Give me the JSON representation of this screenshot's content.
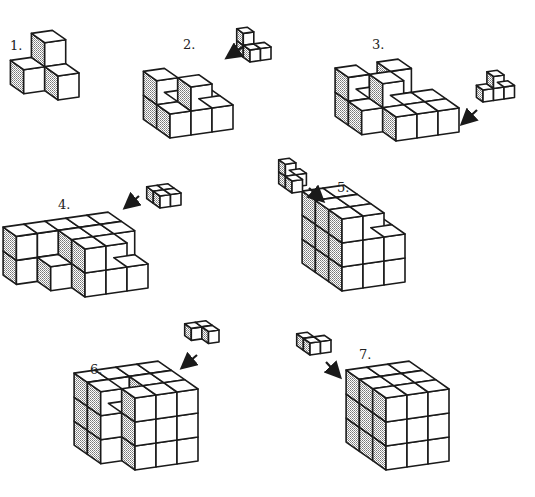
{
  "colors": {
    "line": "#1a1a1a",
    "face": "#ffffff",
    "shade": "#a8a8a8"
  },
  "steps": [
    {
      "label": "1.",
      "label_pos": [
        10,
        38
      ],
      "origin": [
        58,
        100
      ],
      "cubes": [
        [
          0,
          0,
          0
        ],
        [
          -1,
          1,
          0
        ],
        [
          0,
          1,
          0
        ],
        [
          0,
          1,
          1
        ]
      ],
      "piece": null,
      "arrow": null
    },
    {
      "label": "2.",
      "label_pos": [
        183,
        37
      ],
      "origin": [
        170,
        138
      ],
      "cubes": [
        [
          0,
          0,
          0
        ],
        [
          1,
          0,
          0
        ],
        [
          2,
          0,
          0
        ],
        [
          0,
          1,
          0
        ],
        [
          1,
          1,
          0
        ],
        [
          2,
          1,
          0
        ],
        [
          0,
          1,
          1
        ],
        [
          1,
          0,
          1
        ]
      ],
      "piece": {
        "origin": [
          250,
          62
        ],
        "scale": 0.5,
        "cubes": [
          [
            0,
            0,
            0
          ],
          [
            1,
            0,
            0
          ],
          [
            0,
            1,
            0
          ],
          [
            0,
            1,
            1
          ]
        ]
      },
      "arrow": {
        "from": [
          244,
          46
        ],
        "to": [
          228,
          57
        ]
      }
    },
    {
      "label": "3.",
      "label_pos": [
        372,
        37
      ],
      "origin": [
        396,
        141
      ],
      "cubes": [
        [
          0,
          0,
          0
        ],
        [
          1,
          0,
          0
        ],
        [
          2,
          0,
          0
        ],
        [
          -1,
          1,
          0
        ],
        [
          0,
          1,
          0
        ],
        [
          1,
          1,
          0
        ],
        [
          2,
          1,
          0
        ],
        [
          -1,
          2,
          0
        ],
        [
          0,
          2,
          0
        ],
        [
          1,
          2,
          0
        ],
        [
          -1,
          2,
          1
        ],
        [
          0,
          1,
          1
        ],
        [
          1,
          2,
          1
        ]
      ],
      "piece": {
        "origin": [
          483,
          102
        ],
        "scale": 0.5,
        "cubes": [
          [
            0,
            0,
            0
          ],
          [
            1,
            0,
            0
          ],
          [
            2,
            0,
            0
          ],
          [
            1,
            0,
            1
          ]
        ]
      },
      "arrow": {
        "from": [
          477,
          110
        ],
        "to": [
          463,
          123
        ]
      }
    },
    {
      "label": "4.",
      "label_pos": [
        58,
        197
      ],
      "origin": [
        85,
        297
      ],
      "cubes": [
        [
          0,
          0,
          0
        ],
        [
          1,
          0,
          0
        ],
        [
          2,
          0,
          0
        ],
        [
          0,
          1,
          0
        ],
        [
          1,
          1,
          0
        ],
        [
          2,
          1,
          0
        ],
        [
          -1,
          2,
          0
        ],
        [
          0,
          2,
          0
        ],
        [
          1,
          2,
          0
        ],
        [
          2,
          2,
          0
        ],
        [
          -1,
          1,
          0
        ],
        [
          -2,
          2,
          0
        ],
        [
          0,
          0,
          1
        ],
        [
          1,
          0,
          1
        ],
        [
          0,
          1,
          1
        ],
        [
          1,
          1,
          1
        ],
        [
          2,
          1,
          1
        ],
        [
          -1,
          2,
          1
        ],
        [
          0,
          2,
          1
        ],
        [
          1,
          2,
          1
        ],
        [
          2,
          2,
          1
        ],
        [
          -2,
          2,
          1
        ]
      ],
      "piece": {
        "origin": [
          160,
          208
        ],
        "scale": 0.5,
        "cubes": [
          [
            0,
            0,
            0
          ],
          [
            0,
            1,
            0
          ],
          [
            1,
            0,
            0
          ],
          [
            1,
            1,
            0
          ]
        ]
      },
      "arrow": {
        "from": [
          139,
          196
        ],
        "to": [
          126,
          207
        ]
      }
    },
    {
      "label": "5.",
      "label_pos": [
        337,
        180
      ],
      "origin": [
        342,
        291
      ],
      "cubes": [
        [
          0,
          0,
          0
        ],
        [
          1,
          0,
          0
        ],
        [
          2,
          0,
          0
        ],
        [
          0,
          1,
          0
        ],
        [
          1,
          1,
          0
        ],
        [
          2,
          1,
          0
        ],
        [
          0,
          2,
          0
        ],
        [
          1,
          2,
          0
        ],
        [
          2,
          2,
          0
        ],
        [
          0,
          0,
          1
        ],
        [
          1,
          0,
          1
        ],
        [
          2,
          0,
          1
        ],
        [
          0,
          1,
          1
        ],
        [
          1,
          1,
          1
        ],
        [
          2,
          1,
          1
        ],
        [
          0,
          2,
          1
        ],
        [
          1,
          2,
          1
        ],
        [
          2,
          2,
          1
        ],
        [
          0,
          0,
          2
        ],
        [
          1,
          0,
          2
        ],
        [
          0,
          1,
          2
        ],
        [
          1,
          1,
          2
        ],
        [
          0,
          2,
          2
        ],
        [
          1,
          2,
          2
        ]
      ],
      "piece": {
        "origin": [
          292,
          193
        ],
        "scale": 0.5,
        "cubes": [
          [
            0,
            0,
            0
          ],
          [
            0,
            1,
            0
          ],
          [
            1,
            1,
            0
          ],
          [
            0,
            1,
            1
          ]
        ]
      },
      "arrow": {
        "from": [
          309,
          188
        ],
        "to": [
          322,
          200
        ]
      }
    },
    {
      "label": "6.",
      "label_pos": [
        90,
        362
      ],
      "origin": [
        135,
        470
      ],
      "cubes": [
        [
          0,
          0,
          0
        ],
        [
          1,
          0,
          0
        ],
        [
          2,
          0,
          0
        ],
        [
          -1,
          1,
          0
        ],
        [
          0,
          1,
          0
        ],
        [
          1,
          1,
          0
        ],
        [
          2,
          1,
          0
        ],
        [
          -1,
          2,
          0
        ],
        [
          0,
          2,
          0
        ],
        [
          1,
          2,
          0
        ],
        [
          2,
          2,
          0
        ],
        [
          0,
          0,
          1
        ],
        [
          1,
          0,
          1
        ],
        [
          2,
          0,
          1
        ],
        [
          -1,
          1,
          1
        ],
        [
          0,
          1,
          1
        ],
        [
          1,
          1,
          1
        ],
        [
          2,
          1,
          1
        ],
        [
          -1,
          2,
          1
        ],
        [
          0,
          2,
          1
        ],
        [
          1,
          2,
          1
        ],
        [
          2,
          2,
          1
        ],
        [
          0,
          0,
          2
        ],
        [
          1,
          0,
          2
        ],
        [
          2,
          0,
          2
        ],
        [
          1,
          1,
          2
        ],
        [
          2,
          1,
          2
        ],
        [
          0,
          2,
          2
        ],
        [
          1,
          2,
          2
        ],
        [
          2,
          2,
          2
        ],
        [
          -1,
          1,
          2
        ],
        [
          -1,
          2,
          2
        ]
      ],
      "piece": {
        "origin": [
          198,
          345
        ],
        "scale": 0.5,
        "cubes": [
          [
            0,
            1,
            0
          ],
          [
            1,
            1,
            0
          ],
          [
            1,
            0,
            0
          ]
        ]
      },
      "arrow": {
        "from": [
          197,
          355
        ],
        "to": [
          183,
          367
        ]
      }
    },
    {
      "label": "7.",
      "label_pos": [
        359,
        347
      ],
      "origin": [
        386,
        470
      ],
      "cubes": "full3",
      "piece": {
        "origin": [
          310,
          355
        ],
        "scale": 0.5,
        "cubes": [
          [
            0,
            0,
            0
          ],
          [
            1,
            0,
            0
          ],
          [
            0,
            1,
            0
          ]
        ]
      },
      "arrow": {
        "from": [
          326,
          362
        ],
        "to": [
          339,
          376
        ]
      }
    }
  ]
}
